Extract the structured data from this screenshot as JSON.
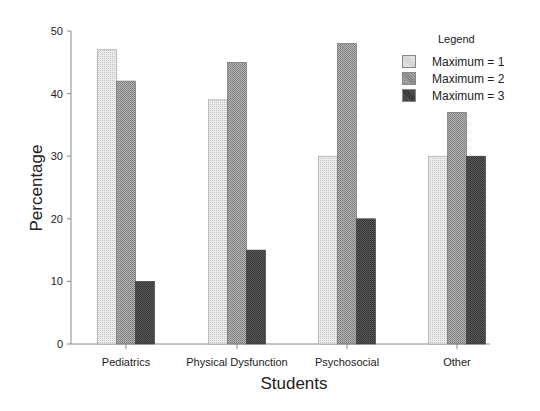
{
  "chart_data": {
    "type": "bar",
    "title": "",
    "xlabel": "Students",
    "ylabel": "Percentage",
    "ylim": [
      0,
      50
    ],
    "yticks": [
      0,
      10,
      20,
      30,
      40,
      50
    ],
    "grid": false,
    "legend_position": "upper right",
    "legend_title": "Legend",
    "categories": [
      "Pediatrics",
      "Physical Dysfunction",
      "Psychosocial",
      "Other"
    ],
    "series": [
      {
        "name": "Maximum = 1",
        "values": [
          47,
          39,
          30,
          30
        ],
        "color": "#d8d8d8"
      },
      {
        "name": "Maximum = 2",
        "values": [
          42,
          45,
          48,
          37
        ],
        "color": "#9a9a9a"
      },
      {
        "name": "Maximum = 3",
        "values": [
          10,
          15,
          20,
          30
        ],
        "color": "#4a4a4a"
      }
    ]
  },
  "legend": {
    "title": "Legend",
    "items": [
      {
        "label": "Maximum = 1"
      },
      {
        "label": "Maximum = 2"
      },
      {
        "label": "Maximum = 3"
      }
    ]
  }
}
